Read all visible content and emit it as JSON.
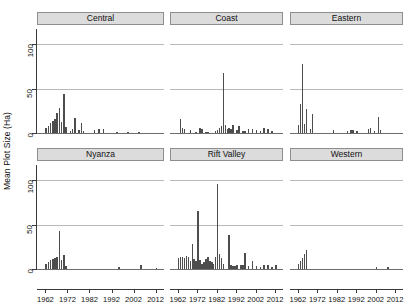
{
  "chart_data": {
    "type": "bar",
    "title": "",
    "xlabel": "",
    "ylabel": "Mean Plot Size (Ha)",
    "ylim": [
      0,
      118
    ],
    "yticks": [
      0,
      50,
      100
    ],
    "ytick_labels": [
      "0",
      "50",
      "100"
    ],
    "xlim": [
      1960,
      2014
    ],
    "xticks": [
      1962,
      1972,
      1982,
      1992,
      2002,
      2012
    ],
    "xtick_labels": [
      "1962",
      "1972",
      "1982",
      "1992",
      "2002",
      "2012"
    ],
    "grid": "horizontal gridlines at y=50 and y=100",
    "legend": "none",
    "facet_layout": "2 rows x 3 columns",
    "panels": [
      {
        "label": "Central",
        "row": 0,
        "col": 0,
        "x": [
          1962,
          1963,
          1964,
          1965,
          1966,
          1967,
          1968,
          1969,
          1970,
          1971,
          1973,
          1974,
          1975,
          1977,
          1978,
          1979,
          1984,
          1986,
          1988,
          1994,
          1999,
          2004
        ],
        "values": [
          6,
          8,
          11,
          14,
          16,
          22,
          28,
          12,
          44,
          7,
          2,
          4,
          17,
          3,
          11,
          2,
          3,
          5,
          5,
          1,
          1,
          1
        ]
      },
      {
        "label": "Coast",
        "row": 0,
        "col": 1,
        "x": [
          1963,
          1964,
          1965,
          1968,
          1971,
          1973,
          1974,
          1976,
          1977,
          1981,
          1982,
          1983,
          1984,
          1985,
          1986,
          1987,
          1988,
          1989,
          1990,
          1992,
          1993,
          1995,
          1996,
          1998,
          2000,
          2002,
          2004,
          2006,
          2008,
          2010
        ],
        "values": [
          16,
          6,
          5,
          3,
          1,
          6,
          5,
          1,
          1,
          2,
          3,
          6,
          8,
          67,
          9,
          5,
          6,
          4,
          9,
          3,
          8,
          2,
          2,
          4,
          5,
          3,
          2,
          6,
          4,
          2
        ]
      },
      {
        "label": "Eastern",
        "row": 0,
        "col": 2,
        "x": [
          1962,
          1963,
          1964,
          1965,
          1966,
          1968,
          1969,
          1980,
          1987,
          1989,
          1990,
          1992,
          1998,
          1999,
          2001,
          2003,
          2004
        ],
        "values": [
          9,
          33,
          78,
          10,
          27,
          4,
          21,
          3,
          2,
          3,
          3,
          2,
          5,
          6,
          2,
          18,
          3
        ]
      },
      {
        "label": "Nyanza",
        "row": 1,
        "col": 0,
        "x": [
          1962,
          1963,
          1964,
          1965,
          1966,
          1967,
          1968,
          1969,
          1970,
          1971,
          1995,
          2005,
          2012
        ],
        "values": [
          6,
          8,
          10,
          11,
          12,
          14,
          43,
          10,
          16,
          3,
          2,
          4,
          1
        ]
      },
      {
        "label": "Rift Valley",
        "row": 1,
        "col": 1,
        "x": [
          1962,
          1963,
          1964,
          1965,
          1966,
          1967,
          1968,
          1969,
          1970,
          1971,
          1972,
          1973,
          1974,
          1975,
          1976,
          1977,
          1978,
          1979,
          1980,
          1981,
          1982,
          1983,
          1984,
          1985,
          1988,
          1989,
          1990,
          1991,
          1992,
          1994,
          1995,
          1996,
          1998,
          2000,
          2002,
          2004,
          2006,
          2008,
          2010,
          2012
        ],
        "values": [
          12,
          14,
          13,
          12,
          15,
          14,
          9,
          28,
          11,
          9,
          65,
          10,
          6,
          8,
          11,
          13,
          9,
          8,
          6,
          13,
          96,
          17,
          12,
          6,
          38,
          5,
          3,
          3,
          5,
          4,
          5,
          18,
          3,
          9,
          3,
          2,
          4,
          5,
          2,
          4
        ]
      },
      {
        "label": "Western",
        "row": 1,
        "col": 2,
        "x": [
          1962,
          1963,
          1964,
          1965,
          1966,
          2002,
          2008
        ],
        "values": [
          6,
          9,
          12,
          17,
          21,
          2,
          2
        ]
      }
    ]
  },
  "axis": {
    "y_title": "Mean Plot Size (Ha)"
  }
}
